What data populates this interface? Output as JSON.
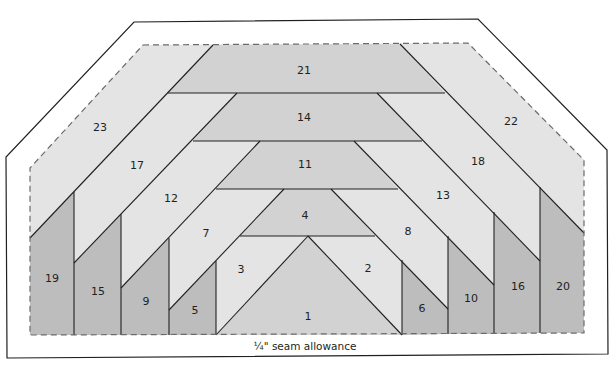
{
  "diagram": {
    "caption": "¼\" seam allowance",
    "colors": {
      "light": "#e4e4e4",
      "medium": "#d2d2d2",
      "dark": "#bdbdbd",
      "line": "#231f20",
      "outline": "#231f20",
      "dashed": "#6b6b6b"
    },
    "pieces": [
      {
        "id": "1",
        "label": "1",
        "shade": "medium"
      },
      {
        "id": "2",
        "label": "2",
        "shade": "light"
      },
      {
        "id": "3",
        "label": "3",
        "shade": "light"
      },
      {
        "id": "4",
        "label": "4",
        "shade": "medium"
      },
      {
        "id": "5",
        "label": "5",
        "shade": "dark"
      },
      {
        "id": "6",
        "label": "6",
        "shade": "dark"
      },
      {
        "id": "7",
        "label": "7",
        "shade": "light"
      },
      {
        "id": "8",
        "label": "8",
        "shade": "light"
      },
      {
        "id": "9",
        "label": "9",
        "shade": "dark"
      },
      {
        "id": "10",
        "label": "10",
        "shade": "dark"
      },
      {
        "id": "11",
        "label": "11",
        "shade": "medium"
      },
      {
        "id": "12",
        "label": "12",
        "shade": "light"
      },
      {
        "id": "13",
        "label": "13",
        "shade": "light"
      },
      {
        "id": "14",
        "label": "14",
        "shade": "medium"
      },
      {
        "id": "15",
        "label": "15",
        "shade": "dark"
      },
      {
        "id": "16",
        "label": "16",
        "shade": "dark"
      },
      {
        "id": "17",
        "label": "17",
        "shade": "light"
      },
      {
        "id": "18",
        "label": "18",
        "shade": "light"
      },
      {
        "id": "19",
        "label": "19",
        "shade": "dark"
      },
      {
        "id": "20",
        "label": "20",
        "shade": "dark"
      },
      {
        "id": "21",
        "label": "21",
        "shade": "medium"
      },
      {
        "id": "22",
        "label": "22",
        "shade": "light"
      },
      {
        "id": "23",
        "label": "23",
        "shade": "light"
      }
    ]
  }
}
